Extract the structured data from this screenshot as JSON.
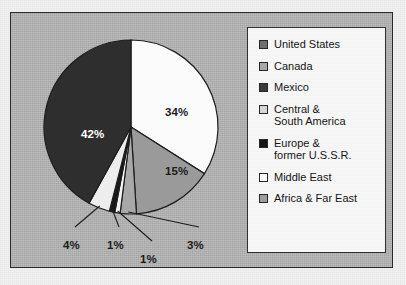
{
  "chart_data": {
    "type": "pie",
    "title": "",
    "categories": [
      "United States",
      "Canada",
      "Mexico",
      "Central & South America",
      "Europe & former U.S.S.R.",
      "Middle East",
      "Africa & Far East"
    ],
    "values": [
      1,
      4,
      1,
      3,
      42,
      34,
      15
    ],
    "value_labels": [
      "1%",
      "4%",
      "1%",
      "3%",
      "42%",
      "34%",
      "15%"
    ],
    "units": "percent",
    "legend_position": "right",
    "grid": false,
    "colors": [
      "#f4f4f4",
      "#ededed",
      "#1a1a1a",
      "#a8a8a8",
      "#2e2e2e",
      "#fbfbfb",
      "#9a9a9a"
    ],
    "slices": [
      {
        "label": "Middle East",
        "value": 34,
        "value_label": "34%",
        "color": "#fbfbfb",
        "start_deg": 0,
        "sweep_deg": 122.4,
        "label_pos": "inside",
        "label_x": 154,
        "label_y": 93,
        "on_dark": false
      },
      {
        "label": "Africa & Far East",
        "value": 15,
        "value_label": "15%",
        "color": "#9a9a9a",
        "start_deg": 122.4,
        "sweep_deg": 54.0,
        "label_pos": "inside",
        "label_x": 154,
        "label_y": 152,
        "on_dark": false
      },
      {
        "label": "Central & South America",
        "value": 3,
        "value_label": "3%",
        "color": "#a8a8a8",
        "start_deg": 176.4,
        "sweep_deg": 10.8,
        "label_pos": "outside",
        "label_x": 176,
        "label_y": 226,
        "on_dark": false
      },
      {
        "label": "United States",
        "value": 1,
        "value_label": "1%",
        "color": "#f4f4f4",
        "start_deg": 187.2,
        "sweep_deg": 3.6,
        "label_pos": "outside",
        "label_x": 129,
        "label_y": 240,
        "on_dark": false
      },
      {
        "label": "Mexico",
        "value": 1,
        "value_label": "1%",
        "color": "#1a1a1a",
        "start_deg": 190.8,
        "sweep_deg": 3.6,
        "label_pos": "outside",
        "label_x": 96,
        "label_y": 226,
        "on_dark": false
      },
      {
        "label": "Canada",
        "value": 4,
        "value_label": "4%",
        "color": "#ededed",
        "start_deg": 194.4,
        "sweep_deg": 14.4,
        "label_pos": "outside",
        "label_x": 52,
        "label_y": 226,
        "on_dark": false
      },
      {
        "label": "Europe & former U.S.S.R.",
        "value": 42,
        "value_label": "42%",
        "color": "#2e2e2e",
        "start_deg": 208.8,
        "sweep_deg": 151.2,
        "label_pos": "inside",
        "label_x": 70,
        "label_y": 115,
        "on_dark": true
      }
    ]
  },
  "legend": {
    "items": [
      {
        "label": "United States",
        "swatch": "#6e6e6e"
      },
      {
        "label": "Canada",
        "swatch": "#a9a9a9"
      },
      {
        "label": "Mexico",
        "swatch": "#3a3a3a"
      },
      {
        "label": "Central &\nSouth America",
        "swatch": "#d6d6d6"
      },
      {
        "label": "Europe &\nformer U.S.S.R.",
        "swatch": "#151515"
      },
      {
        "label": "Middle East",
        "swatch": "#ffffff"
      },
      {
        "label": "Africa & Far East",
        "swatch": "#9d9d9d"
      }
    ]
  }
}
